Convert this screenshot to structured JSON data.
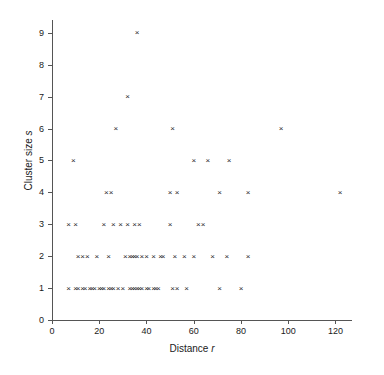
{
  "chart_data": {
    "type": "scatter",
    "title": "",
    "xlabel": "Distance r",
    "xlabel_plain": "Distance",
    "xlabel_italic": "r",
    "ylabel": "Cluster size s",
    "ylabel_plain": "Cluster size",
    "ylabel_italic": "s",
    "xlim": [
      0,
      127
    ],
    "ylim": [
      0,
      9.4
    ],
    "xticks": [
      0,
      20,
      40,
      60,
      80,
      100,
      120
    ],
    "yticks": [
      0,
      1,
      2,
      3,
      4,
      5,
      6,
      7,
      8,
      9
    ],
    "xtick_labels": [
      "0",
      "20",
      "40",
      "60",
      "80",
      "100",
      "120"
    ],
    "ytick_labels": [
      "0",
      "1",
      "2",
      "3",
      "4",
      "5",
      "6",
      "7",
      "8",
      "9"
    ],
    "grid": false,
    "legend": null,
    "marker": "x",
    "marker_color": "#2b2b2b",
    "series": [
      {
        "name": "cluster observations",
        "points": [
          [
            36,
            9
          ],
          [
            32,
            7
          ],
          [
            27,
            6
          ],
          [
            51,
            6
          ],
          [
            97,
            6
          ],
          [
            9,
            5
          ],
          [
            60,
            5
          ],
          [
            66,
            5
          ],
          [
            75,
            5
          ],
          [
            23,
            4
          ],
          [
            25,
            4
          ],
          [
            50,
            4
          ],
          [
            53,
            4
          ],
          [
            71,
            4
          ],
          [
            83,
            4
          ],
          [
            122,
            4
          ],
          [
            7,
            3
          ],
          [
            10,
            3
          ],
          [
            22,
            3
          ],
          [
            26,
            3
          ],
          [
            29,
            3
          ],
          [
            32,
            3
          ],
          [
            35,
            3
          ],
          [
            37,
            3
          ],
          [
            50,
            3
          ],
          [
            62,
            3
          ],
          [
            64,
            3
          ],
          [
            11,
            2
          ],
          [
            13,
            2
          ],
          [
            15,
            2
          ],
          [
            19,
            2
          ],
          [
            24,
            2
          ],
          [
            31,
            2
          ],
          [
            33,
            2
          ],
          [
            34,
            2
          ],
          [
            35,
            2
          ],
          [
            36,
            2
          ],
          [
            38,
            2
          ],
          [
            40,
            2
          ],
          [
            43,
            2
          ],
          [
            46,
            2
          ],
          [
            47,
            2
          ],
          [
            52,
            2
          ],
          [
            56,
            2
          ],
          [
            60,
            2
          ],
          [
            68,
            2
          ],
          [
            74,
            2
          ],
          [
            83,
            2
          ],
          [
            7,
            1
          ],
          [
            10,
            1
          ],
          [
            11,
            1
          ],
          [
            13,
            1
          ],
          [
            14,
            1
          ],
          [
            16,
            1
          ],
          [
            17,
            1
          ],
          [
            18,
            1
          ],
          [
            20,
            1
          ],
          [
            21,
            1
          ],
          [
            22,
            1
          ],
          [
            24,
            1
          ],
          [
            25,
            1
          ],
          [
            26,
            1
          ],
          [
            28,
            1
          ],
          [
            30,
            1
          ],
          [
            33,
            1
          ],
          [
            34,
            1
          ],
          [
            35,
            1
          ],
          [
            36,
            1
          ],
          [
            37,
            1
          ],
          [
            38,
            1
          ],
          [
            40,
            1
          ],
          [
            41,
            1
          ],
          [
            43,
            1
          ],
          [
            44,
            1
          ],
          [
            45,
            1
          ],
          [
            51,
            1
          ],
          [
            53,
            1
          ],
          [
            57,
            1
          ],
          [
            71,
            1
          ],
          [
            80,
            1
          ]
        ]
      }
    ]
  }
}
